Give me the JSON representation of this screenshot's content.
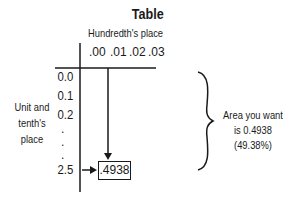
{
  "title": "Table",
  "column_header_label": "Hundredth's place",
  "columns": [
    ".00",
    ".01",
    ".02",
    ".03"
  ],
  "row_header_label_lines": [
    "Unit and",
    "tenth's",
    "place"
  ],
  "rows": [
    "0.0",
    "0.1",
    "0.2",
    "2.5"
  ],
  "ellipsis_dots": [
    ".",
    ".",
    "."
  ],
  "answer_cell": ".4938",
  "annotation_lines": [
    "Area you want",
    "is 0.4938",
    "(49.38%)"
  ],
  "colors": {
    "ink": "#1a1a1a",
    "background": "#ffffff"
  }
}
